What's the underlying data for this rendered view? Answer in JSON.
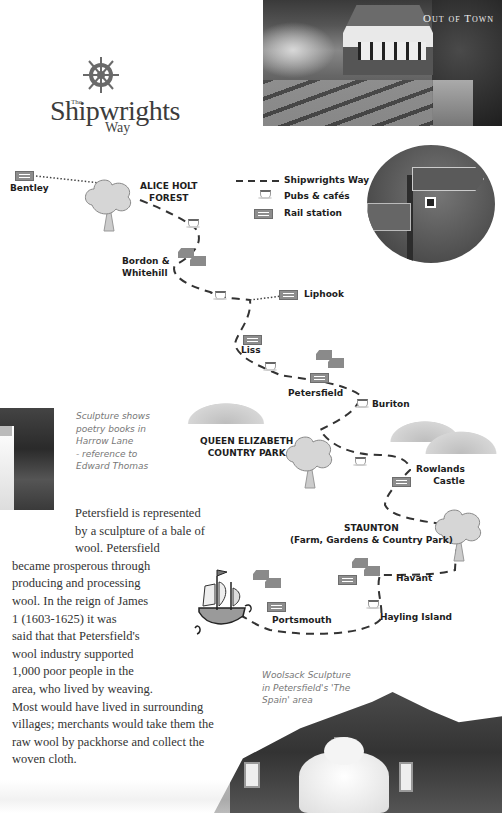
{
  "header": {
    "section_label": "Out of Town"
  },
  "logo": {
    "the": "The",
    "title": "Shipwrights",
    "way": "Way",
    "icon": "ship-wheel-icon"
  },
  "legend": {
    "items": [
      {
        "icon": "dashed-line-icon",
        "label": "Shipwrights Way"
      },
      {
        "icon": "cup-icon",
        "label": "Pubs & cafés"
      },
      {
        "icon": "rail-icon",
        "label": "Rail station"
      }
    ]
  },
  "map": {
    "places": [
      {
        "name": "Bentley",
        "type": "rail"
      },
      {
        "name": "ALICE HOLT FOREST",
        "line1": "ALICE HOLT",
        "line2": "FOREST",
        "type": "forest"
      },
      {
        "name": "Bordon & Whitehill",
        "line1": "Bordon &",
        "line2": "Whitehill",
        "type": "town"
      },
      {
        "name": "Liphook",
        "type": "rail"
      },
      {
        "name": "Liss",
        "type": "rail"
      },
      {
        "name": "Petersfield",
        "type": "rail"
      },
      {
        "name": "Buriton",
        "type": "cafe"
      },
      {
        "name": "QUEEN ELIZABETH COUNTRY PARK",
        "line1": "QUEEN ELIZABETH",
        "line2": "COUNTRY PARK",
        "type": "park"
      },
      {
        "name": "Rowlands Castle",
        "line1": "Rowlands",
        "line2": "Castle",
        "type": "rail"
      },
      {
        "name": "STAUNTON (Farm, Gardens & Country Park)",
        "line1": "STAUNTON",
        "line2": "(Farm, Gardens & Country Park)",
        "type": "park"
      },
      {
        "name": "Havant",
        "type": "rail"
      },
      {
        "name": "Hayling Island",
        "type": "cafe"
      },
      {
        "name": "Portsmouth",
        "type": "rail"
      }
    ]
  },
  "captions": {
    "sculpture": [
      "Sculpture shows",
      "poetry books in",
      "Harrow Lane",
      "- reference to",
      "Edward Thomas"
    ],
    "woolsack": [
      "Woolsack Sculpture",
      "in Petersfield's 'The",
      "Spain' area"
    ]
  },
  "body": {
    "lines": [
      "Petersfield is represented",
      "by a sculpture of a bale of",
      "wool. Petersfield",
      "became prosperous through",
      "producing and processing",
      "wool. In the reign of James",
      "1 (1603-1625) it was",
      "said that that Petersfield's",
      "wool industry supported",
      "1,000 poor people in the",
      "area, who lived by weaving.",
      "Most would have lived in surrounding",
      "villages; merchants would take them the",
      "raw wool by packhorse and collect the",
      "woven cloth."
    ]
  },
  "colors": {
    "route": "#3a3a3a",
    "label": "#1d1d1d",
    "caption": "#777777",
    "body": "#333333",
    "icon_grey": "#8d8d8d"
  }
}
